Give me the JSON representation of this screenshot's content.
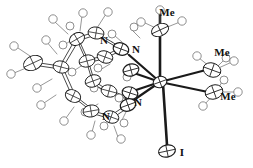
{
  "figure": {
    "kind": "ortep-crystal-structure",
    "title": "",
    "background_color": "#ffffff",
    "line_color": "#1a1a1a",
    "ellipsoid_fill": "#ffffff",
    "width": 253,
    "height": 168
  },
  "labels": {
    "nitrogen": [
      {
        "id": "n-upper-left",
        "text": "N",
        "x": 104,
        "y": 44
      },
      {
        "id": "n-upper-right",
        "text": "N",
        "x": 136,
        "y": 53
      },
      {
        "id": "n-lower-right",
        "text": "N",
        "x": 138,
        "y": 106
      },
      {
        "id": "n-lower-left",
        "text": "N",
        "x": 106,
        "y": 120
      }
    ],
    "methyl": [
      {
        "id": "me-top",
        "text": "Me",
        "x": 167,
        "y": 16
      },
      {
        "id": "me-right-upper",
        "text": "Me",
        "x": 222,
        "y": 56
      },
      {
        "id": "me-right-lower",
        "text": "Me",
        "x": 228,
        "y": 100
      }
    ],
    "iodine": [
      {
        "id": "i-bottom",
        "text": "I",
        "x": 182,
        "y": 156
      }
    ]
  },
  "atoms": {
    "metal_center": {
      "name": "metal-center",
      "x": 160,
      "y": 82,
      "rx": 7,
      "ry": 6,
      "rot": -20
    },
    "iodide": {
      "name": "iodide-atom",
      "x": 167,
      "y": 151,
      "rx": 8,
      "ry": 6,
      "rot": -15
    },
    "methyl_carbons": [
      {
        "name": "methyl-carbon-top",
        "x": 160,
        "y": 30,
        "rx": 8,
        "ry": 6,
        "rot": -25
      },
      {
        "name": "methyl-carbon-right-upper",
        "x": 214,
        "y": 70,
        "rx": 8,
        "ry": 7,
        "rot": 20
      },
      {
        "name": "methyl-carbon-right-lower",
        "x": 216,
        "y": 92,
        "rx": 8,
        "ry": 7,
        "rot": -20
      }
    ]
  },
  "bonds": {
    "axial_top_label": "metal-to-methyl-top",
    "axial_bottom_label": "metal-to-iodide",
    "equatorial_count": 4
  },
  "legend": {
    "note": ""
  }
}
